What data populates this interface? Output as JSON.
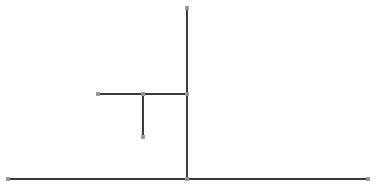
{
  "diagram": {
    "type": "tree-skeleton",
    "colors": {
      "edge": "#3a3a3a",
      "node": "#8c8c8c",
      "background": "#ffffff"
    },
    "nodes": [
      {
        "id": "top",
        "x": 187,
        "y": 8
      },
      {
        "id": "branch-junction",
        "x": 187,
        "y": 94
      },
      {
        "id": "branch-left",
        "x": 98,
        "y": 94
      },
      {
        "id": "stub-top",
        "x": 143,
        "y": 94
      },
      {
        "id": "stub-bottom",
        "x": 143,
        "y": 137
      },
      {
        "id": "base-center",
        "x": 187,
        "y": 179
      },
      {
        "id": "base-left",
        "x": 8,
        "y": 179
      },
      {
        "id": "base-right",
        "x": 368,
        "y": 179
      }
    ],
    "edges": [
      {
        "from": "top",
        "to": "base-center"
      },
      {
        "from": "branch-left",
        "to": "branch-junction"
      },
      {
        "from": "stub-top",
        "to": "stub-bottom"
      },
      {
        "from": "base-left",
        "to": "base-right"
      }
    ]
  }
}
